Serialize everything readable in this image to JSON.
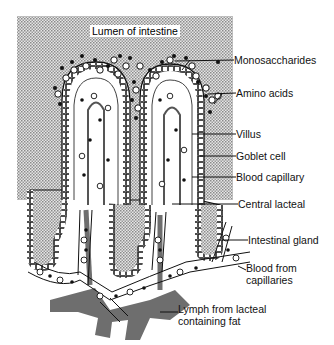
{
  "diagram": {
    "title_region": "Lumen of intestine",
    "labels": [
      {
        "id": "monosaccharides",
        "text": "Monosaccharides",
        "x": 234,
        "y": 54
      },
      {
        "id": "amino-acids",
        "text": "Amino acids",
        "x": 236,
        "y": 87
      },
      {
        "id": "villus",
        "text": "Villus",
        "x": 236,
        "y": 128
      },
      {
        "id": "goblet-cell",
        "text": "Goblet cell",
        "x": 236,
        "y": 150
      },
      {
        "id": "blood-capillary",
        "text": "Blood capillary",
        "x": 236,
        "y": 171
      },
      {
        "id": "central-lacteal",
        "text": "Central lacteal",
        "x": 238,
        "y": 198
      },
      {
        "id": "intestinal-gland",
        "text": "Intestinal gland",
        "x": 248,
        "y": 234
      },
      {
        "id": "blood-from-capillaries",
        "text": "Blood from\ncapillaries",
        "x": 246,
        "y": 262
      },
      {
        "id": "lymph-from-lacteal",
        "text": "Lymph from lacteal\ncontaining fat",
        "x": 178,
        "y": 303
      }
    ],
    "legend_markers": {
      "monosaccharides": "filled-dot",
      "amino_acids": "open-circle"
    },
    "colors": {
      "stipple": "#c8c8c8",
      "ink": "#111111",
      "lymph": "#6e6e6e",
      "background": "#ffffff"
    }
  }
}
